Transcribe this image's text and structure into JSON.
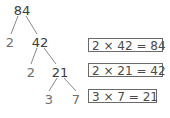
{
  "tree": {
    "nodes": [
      {
        "id": "n84",
        "label": "84",
        "type": "composite",
        "x": 22,
        "y": 4
      },
      {
        "id": "n2a",
        "label": "2",
        "type": "prime",
        "x": 10,
        "y": 36
      },
      {
        "id": "n42",
        "label": "42",
        "type": "composite",
        "x": 40,
        "y": 36
      },
      {
        "id": "n2b",
        "label": "2",
        "type": "prime",
        "x": 31,
        "y": 66
      },
      {
        "id": "n21",
        "label": "21",
        "type": "composite",
        "x": 60,
        "y": 66
      },
      {
        "id": "n3",
        "label": "3",
        "type": "prime",
        "x": 49,
        "y": 93
      },
      {
        "id": "n7",
        "label": "7",
        "type": "prime",
        "x": 76,
        "y": 93
      }
    ],
    "edges": [
      {
        "from": "n84",
        "to": "n2a",
        "x1": 18,
        "y1": 16,
        "x2": 11,
        "y2": 34
      },
      {
        "from": "n84",
        "to": "n42",
        "x1": 26,
        "y1": 16,
        "x2": 37,
        "y2": 34
      },
      {
        "from": "n42",
        "to": "n2b",
        "x1": 37,
        "y1": 48,
        "x2": 31,
        "y2": 64
      },
      {
        "from": "n42",
        "to": "n21",
        "x1": 44,
        "y1": 48,
        "x2": 56,
        "y2": 64
      },
      {
        "from": "n21",
        "to": "n3",
        "x1": 57,
        "y1": 78,
        "x2": 49,
        "y2": 91
      },
      {
        "from": "n21",
        "to": "n7",
        "x1": 64,
        "y1": 78,
        "x2": 76,
        "y2": 91
      }
    ]
  },
  "equations": [
    {
      "text": "2 × 42 = 84",
      "x": 88,
      "y": 38,
      "w": 75
    },
    {
      "text": "2 × 21 = 42",
      "x": 88,
      "y": 63,
      "w": 75
    },
    {
      "text": "3 × 7 = 21",
      "x": 88,
      "y": 89,
      "w": 69
    }
  ],
  "colors": {
    "composite": "#3a3a3a",
    "prime": "#6f6f6f",
    "edge": "#8a8a8a",
    "box_border": "#6a6a6a"
  }
}
